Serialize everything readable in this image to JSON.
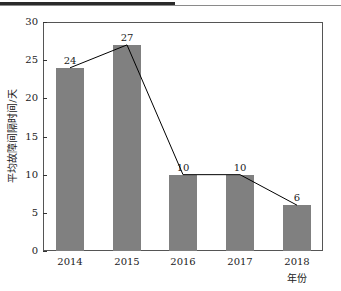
{
  "chart_data": {
    "type": "bar",
    "title": "",
    "xlabel": "年份",
    "ylabel": "平均故障间隔时间/天",
    "categories": [
      "2014",
      "2015",
      "2016",
      "2017",
      "2018"
    ],
    "values": [
      24,
      27,
      10,
      10,
      6
    ],
    "data_labels": [
      "24",
      "27",
      "10",
      "10",
      "6"
    ],
    "overlay_line": {
      "type": "line",
      "values": [
        24,
        27,
        10,
        10,
        6
      ],
      "color": "#000000"
    },
    "ylim": [
      0,
      30
    ],
    "yticks": [
      "0",
      "5",
      "10",
      "15",
      "20",
      "25",
      "30"
    ],
    "grid": false,
    "legend": null,
    "bar_color": "#808080"
  }
}
